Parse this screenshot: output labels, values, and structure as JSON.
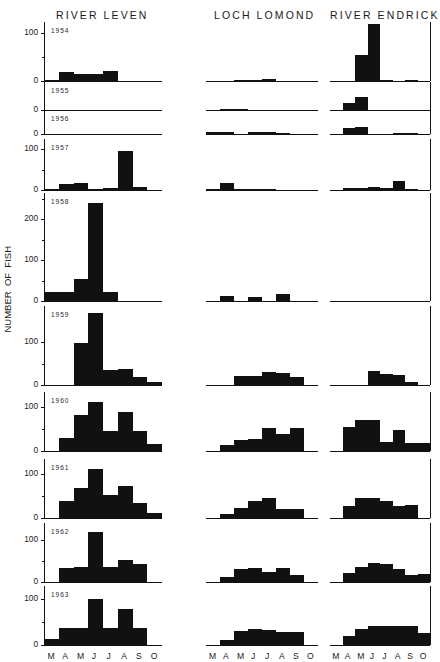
{
  "figure": {
    "ylabel": "NUMBER  OF  FISH",
    "columns": [
      {
        "id": "river-leven",
        "label": "RIVER LEVEN"
      },
      {
        "id": "loch-lomond",
        "label": "LOCH LOMOND"
      },
      {
        "id": "river-endrick",
        "label": "RIVER ENDRICK"
      }
    ],
    "months": [
      "M",
      "A",
      "M",
      "J",
      "J",
      "A",
      "S",
      "O"
    ],
    "years": [
      "1954",
      "1955",
      "1956",
      "1957",
      "1958",
      "1959",
      "1960",
      "1961",
      "1962",
      "1963"
    ]
  },
  "chart_data": {
    "type": "bar",
    "xlabel": "",
    "ylabel": "NUMBER OF FISH",
    "categories": [
      "M",
      "A",
      "M",
      "J",
      "J",
      "A",
      "S",
      "O"
    ],
    "grid": false,
    "legend_position": "none",
    "panel_layout": {
      "rows": 10,
      "cols": 3,
      "row_key": "year",
      "col_key": "site"
    },
    "panels": [
      {
        "year": "1954",
        "ylim": [
          0,
          115
        ],
        "yticks": [
          0,
          100
        ],
        "ytick_labels": [
          "0",
          "100"
        ],
        "series": [
          {
            "name": "RIVER LEVEN",
            "values": [
              3,
              18,
              14,
              14,
              20,
              0,
              0,
              0
            ]
          },
          {
            "name": "LOCH LOMOND",
            "values": [
              0,
              0,
              2,
              2,
              5,
              0,
              0,
              0
            ]
          },
          {
            "name": "RIVER ENDRICK",
            "values": [
              0,
              0,
              55,
              120,
              3,
              0,
              1,
              0
            ]
          }
        ]
      },
      {
        "year": "1955",
        "ylim": [
          0,
          40
        ],
        "yticks": [
          0
        ],
        "ytick_labels": [
          "0"
        ],
        "series": [
          {
            "name": "RIVER LEVEN",
            "values": [
              0,
              0,
              0,
              0,
              0,
              0,
              0,
              0
            ]
          },
          {
            "name": "LOCH LOMOND",
            "values": [
              0,
              1,
              1,
              0,
              0,
              0,
              0,
              0
            ]
          },
          {
            "name": "RIVER ENDRICK",
            "values": [
              0,
              12,
              22,
              0,
              0,
              0,
              0,
              0
            ]
          }
        ]
      },
      {
        "year": "1956",
        "ylim": [
          0,
          36
        ],
        "yticks": [
          0
        ],
        "ytick_labels": [
          "0"
        ],
        "series": [
          {
            "name": "RIVER LEVEN",
            "values": [
              0,
              0,
              0,
              0,
              0,
              0,
              0,
              0
            ]
          },
          {
            "name": "LOCH LOMOND",
            "values": [
              3,
              3,
              0,
              4,
              4,
              1,
              0,
              0
            ]
          },
          {
            "name": "RIVER ENDRICK",
            "values": [
              0,
              10,
              12,
              0,
              0,
              2,
              2,
              0
            ]
          }
        ]
      },
      {
        "year": "1957",
        "ylim": [
          0,
          115
        ],
        "yticks": [
          0,
          100
        ],
        "ytick_labels": [
          "0",
          "100"
        ],
        "series": [
          {
            "name": "RIVER LEVEN",
            "values": [
              3,
              14,
              16,
              3,
              6,
              95,
              8,
              0
            ]
          },
          {
            "name": "LOCH LOMOND",
            "values": [
              2,
              18,
              2,
              2,
              2,
              0,
              0,
              0
            ]
          },
          {
            "name": "RIVER ENDRICK",
            "values": [
              0,
              4,
              5,
              8,
              4,
              22,
              2,
              0
            ]
          }
        ]
      },
      {
        "year": "1958",
        "ylim": [
          0,
          255
        ],
        "yticks": [
          0,
          100,
          200
        ],
        "ytick_labels": [
          "0",
          "100",
          "200"
        ],
        "series": [
          {
            "name": "RIVER LEVEN",
            "values": [
              22,
              22,
              55,
              240,
              22,
              0,
              0,
              0
            ]
          },
          {
            "name": "LOCH LOMOND",
            "values": [
              0,
              12,
              0,
              10,
              0,
              16,
              0,
              0
            ]
          },
          {
            "name": "RIVER ENDRICK",
            "values": [
              0,
              0,
              0,
              0,
              0,
              0,
              0,
              0
            ]
          }
        ]
      },
      {
        "year": "1959",
        "ylim": [
          0,
          175
        ],
        "yticks": [
          0,
          100
        ],
        "ytick_labels": [
          "0",
          "100"
        ],
        "series": [
          {
            "name": "RIVER LEVEN",
            "values": [
              0,
              0,
              98,
              168,
              35,
              38,
              18,
              6
            ]
          },
          {
            "name": "LOCH LOMOND",
            "values": [
              0,
              0,
              20,
              22,
              30,
              28,
              18,
              0
            ]
          },
          {
            "name": "RIVER ENDRICK",
            "values": [
              0,
              0,
              0,
              32,
              26,
              24,
              8,
              0
            ]
          }
        ]
      },
      {
        "year": "1960",
        "ylim": [
          0,
          125
        ],
        "yticks": [
          0,
          100
        ],
        "ytick_labels": [
          "0",
          "100"
        ],
        "series": [
          {
            "name": "RIVER LEVEN",
            "values": [
              0,
              30,
              82,
              112,
              45,
              88,
              45,
              15
            ]
          },
          {
            "name": "LOCH LOMOND",
            "values": [
              0,
              14,
              24,
              28,
              52,
              38,
              52,
              0
            ]
          },
          {
            "name": "RIVER ENDRICK",
            "values": [
              0,
              55,
              70,
              70,
              20,
              48,
              18,
              18
            ]
          }
        ]
      },
      {
        "year": "1961",
        "ylim": [
          0,
          125
        ],
        "yticks": [
          0,
          100
        ],
        "ytick_labels": [
          "0",
          "100"
        ],
        "series": [
          {
            "name": "RIVER LEVEN",
            "values": [
              0,
              38,
              68,
              112,
              52,
              72,
              35,
              12
            ]
          },
          {
            "name": "LOCH LOMOND",
            "values": [
              0,
              10,
              22,
              38,
              46,
              20,
              20,
              0
            ]
          },
          {
            "name": "RIVER ENDRICK",
            "values": [
              0,
              28,
              45,
              45,
              38,
              28,
              30,
              0
            ]
          }
        ]
      },
      {
        "year": "1962",
        "ylim": [
          0,
          130
        ],
        "yticks": [
          0,
          100
        ],
        "ytick_labels": [
          "0",
          "100"
        ],
        "series": [
          {
            "name": "RIVER LEVEN",
            "values": [
              0,
              32,
              36,
              118,
              36,
              52,
              42,
              0
            ]
          },
          {
            "name": "LOCH LOMOND",
            "values": [
              0,
              12,
              30,
              32,
              24,
              32,
              16,
              0
            ]
          },
          {
            "name": "RIVER ENDRICK",
            "values": [
              0,
              22,
              36,
              44,
              42,
              30,
              16,
              20
            ]
          }
        ]
      },
      {
        "year": "1963",
        "ylim": [
          0,
          120
        ],
        "yticks": [
          0,
          100
        ],
        "ytick_labels": [
          "0",
          "100"
        ],
        "series": [
          {
            "name": "RIVER LEVEN",
            "values": [
              14,
              38,
              38,
              100,
              38,
              78,
              38,
              0
            ]
          },
          {
            "name": "LOCH LOMOND",
            "values": [
              0,
              10,
              30,
              34,
              32,
              28,
              28,
              0
            ]
          },
          {
            "name": "RIVER ENDRICK",
            "values": [
              0,
              20,
              34,
              42,
              42,
              42,
              42,
              26
            ]
          }
        ]
      }
    ]
  }
}
